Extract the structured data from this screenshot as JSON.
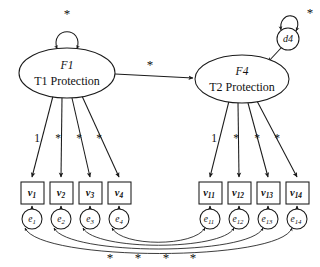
{
  "diagram": {
    "type": "sem-path-diagram",
    "free_parameter_symbol": "*",
    "fixed_loading_value": "1",
    "factors": [
      {
        "id": "F1",
        "name": "T1 Protection",
        "cx": 67,
        "cy": 73,
        "rx": 48,
        "ry": 25,
        "variance_label": "*"
      },
      {
        "id": "F4",
        "name": "T2 Protection",
        "cx": 242,
        "cy": 79,
        "rx": 47,
        "ry": 24,
        "variance_label": null
      }
    ],
    "disturbance": {
      "id": "d4",
      "cx": 288,
      "cy": 39,
      "r": 11,
      "variance_label": "*",
      "target": "F4"
    },
    "structural_path": {
      "from": "F1",
      "to": "F4",
      "label": "*",
      "label_x": 150,
      "label_y": 65
    },
    "indicators_left": [
      {
        "var": "v",
        "var_sub": "1",
        "err": "e",
        "err_sub": "1",
        "x": 21,
        "loading": "1"
      },
      {
        "var": "v",
        "var_sub": "2",
        "err": "e",
        "err_sub": "2",
        "x": 50,
        "loading": "*"
      },
      {
        "var": "v",
        "var_sub": "3",
        "err": "e",
        "err_sub": "3",
        "x": 79,
        "loading": "*"
      },
      {
        "var": "v",
        "var_sub": "4",
        "err": "e",
        "err_sub": "4",
        "x": 108,
        "loading": "*"
      }
    ],
    "indicators_right": [
      {
        "var": "v",
        "var_sub": "11",
        "err": "e",
        "err_sub": "11",
        "x": 199,
        "loading": "1"
      },
      {
        "var": "v",
        "var_sub": "12",
        "err": "e",
        "err_sub": "12",
        "x": 228,
        "loading": "*"
      },
      {
        "var": "v",
        "var_sub": "13",
        "err": "e",
        "err_sub": "13",
        "x": 257,
        "loading": "*"
      },
      {
        "var": "v",
        "var_sub": "14",
        "err": "e",
        "err_sub": "14",
        "x": 286,
        "loading": "*"
      }
    ],
    "loading_label_row_y": 139,
    "box_y": 182,
    "box_w": 23,
    "box_h": 22,
    "err_cy": 219,
    "err_r": 10,
    "error_correlations": [
      {
        "from": "e1",
        "to": "e11",
        "label": "*"
      },
      {
        "from": "e2",
        "to": "e12",
        "label": "*"
      },
      {
        "from": "e3",
        "to": "e13",
        "label": "*"
      },
      {
        "from": "e4",
        "to": "e14",
        "label": "*"
      }
    ],
    "correlation_star_row": {
      "y": 259,
      "labels": [
        "*",
        "*",
        "*",
        "*"
      ],
      "x_positions": [
        110,
        138,
        166,
        193
      ]
    },
    "colors": {
      "stroke": "#1a1a1a",
      "fill": "#ffffff",
      "text": "#111111",
      "background": "#ffffff"
    }
  }
}
